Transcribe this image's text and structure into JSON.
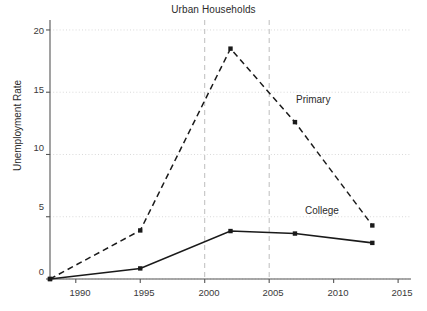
{
  "chart_data": {
    "type": "line",
    "title": "Urban Households",
    "xlabel": "",
    "ylabel": "Unemployment Rate",
    "xlim": [
      1988,
      2016
    ],
    "ylim": [
      0,
      20.8
    ],
    "xticks": [
      1990,
      1995,
      2000,
      2005,
      2010,
      2015
    ],
    "xtick_labels": [
      "1990",
      "1995",
      "2000",
      "2005",
      "2010",
      "2015"
    ],
    "yticks": [
      0,
      5,
      10,
      15,
      20
    ],
    "ytick_labels": [
      "0",
      "5",
      "10",
      "15",
      "20"
    ],
    "grid": "horizontal-dotted",
    "legend_position": "inline-annotation",
    "vlines": [
      2000,
      2005
    ],
    "series": [
      {
        "name": "Primary",
        "style": "dashed",
        "color": "#1a1a1a",
        "x": [
          1988,
          1995,
          2002,
          2007,
          2013
        ],
        "values": [
          0.0,
          3.9,
          18.5,
          12.6,
          4.3
        ],
        "label": "Primary",
        "label_x": 2006.5,
        "label_y": 14.2
      },
      {
        "name": "College",
        "style": "solid",
        "color": "#1a1a1a",
        "x": [
          1988,
          1995,
          2002,
          2007,
          2013
        ],
        "values": [
          0.0,
          0.85,
          3.85,
          3.65,
          2.9
        ],
        "label": "College",
        "label_x": 2008.0,
        "label_y": 5.1
      }
    ]
  },
  "colors": {
    "axis": "#555555",
    "grid": "#d9d9d9",
    "vline": "#bdbdbd",
    "line": "#1a1a1a",
    "text": "#2b2b2b",
    "background": "#ffffff"
  }
}
